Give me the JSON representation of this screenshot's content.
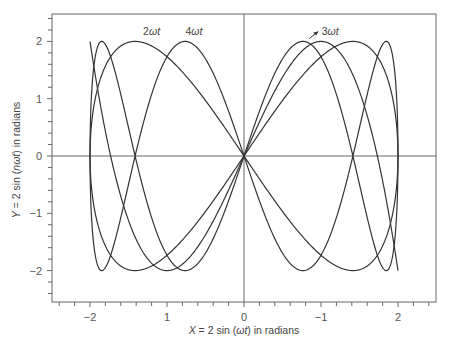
{
  "chart_data": {
    "type": "line",
    "title": "",
    "xlabel": "X = 2 sin (ωt) in radians",
    "ylabel": "Y = 2 sin (nωt) in radians",
    "xlabel_parts": {
      "pre": "X",
      "mid": " = 2 sin (",
      "italic": "ωt",
      "post": ") in radians"
    },
    "ylabel_parts": {
      "pre": "Y",
      "mid": " = 2 sin (",
      "italic": "nωt",
      "post": ") in radians"
    },
    "xlim": [
      -2.5,
      2.5
    ],
    "ylim": [
      -2.55,
      2.48
    ],
    "grid": false,
    "x_ticks": [
      -2,
      -1,
      0,
      1,
      2
    ],
    "x_tick_labels": [
      "−2",
      "1",
      "0",
      "−1",
      "2"
    ],
    "y_ticks": [
      -2,
      -1,
      0,
      1,
      2
    ],
    "y_tick_labels": [
      "−2",
      "−1",
      "0",
      "1",
      "2"
    ],
    "minor_tick_step": 0.2,
    "zero_lines": true,
    "series": [
      {
        "name": "2ωt",
        "n": 2,
        "x_expr": "2 sin(ωt)",
        "y_expr": "2 sin(2ωt)",
        "closed": true,
        "label": "2ωt",
        "label_pos": [
          -1.2,
          2.12
        ],
        "key_points": [
          [
            0,
            0
          ],
          [
            1.414,
            2
          ],
          [
            2,
            0
          ],
          [
            1.414,
            -2
          ],
          [
            0,
            0
          ],
          [
            -1.414,
            2
          ],
          [
            -2,
            0
          ],
          [
            -1.414,
            -2
          ]
        ]
      },
      {
        "name": "3ωt",
        "n": 3,
        "x_expr": "2 sin(ωt)",
        "y_expr": "2 sin(3ωt)",
        "closed": false,
        "label": "3ωt",
        "label_pos": [
          1.12,
          2.12
        ],
        "key_points": [
          [
            -2,
            2
          ],
          [
            -1,
            -2
          ],
          [
            0,
            0
          ],
          [
            1,
            2
          ],
          [
            2,
            -2
          ]
        ]
      },
      {
        "name": "4ωt",
        "n": 4,
        "x_expr": "2 sin(ωt)",
        "y_expr": "2 sin(4ωt)",
        "closed": true,
        "label": "4ωt",
        "label_pos": [
          -0.65,
          2.12
        ],
        "key_points": [
          [
            0,
            0
          ],
          [
            0.765,
            2
          ],
          [
            1.414,
            0
          ],
          [
            1.848,
            -2
          ],
          [
            2,
            0
          ],
          [
            -0.765,
            2
          ],
          [
            -1.414,
            0
          ],
          [
            -1.848,
            -2
          ]
        ]
      }
    ],
    "line_color": "#333333",
    "frame_color": "#666666"
  }
}
